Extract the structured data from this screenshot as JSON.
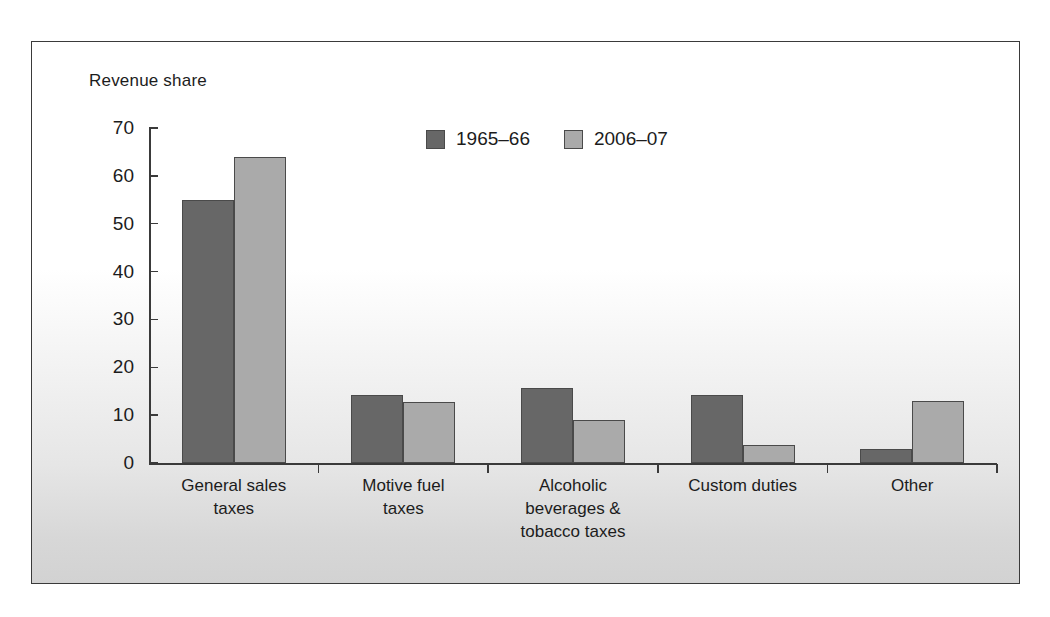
{
  "chart_data": {
    "type": "bar",
    "title": "",
    "subtitle": "",
    "ylabel": "Revenue share",
    "xlabel": "",
    "ylim": [
      0,
      70
    ],
    "yticks": [
      0,
      10,
      20,
      30,
      40,
      50,
      60,
      70
    ],
    "ytick_labels": [
      "0",
      "10",
      "20",
      "30",
      "40",
      "50",
      "60",
      "70"
    ],
    "grid": false,
    "legend_position": "top-center",
    "categories": [
      "General sales\ntaxes",
      "Motive fuel\ntaxes",
      "Alcoholic\nbeverages &\ntobacco taxes",
      "Custom duties",
      "Other"
    ],
    "series": [
      {
        "name": "1965–66",
        "color": "#676767",
        "values": [
          55,
          14.2,
          15.6,
          14.2,
          3
        ]
      },
      {
        "name": "2006–07",
        "color": "#aaaaaa",
        "values": [
          64,
          12.7,
          9,
          3.8,
          13
        ]
      }
    ]
  },
  "legend": {
    "items": [
      {
        "label": "1965–66",
        "color": "#676767"
      },
      {
        "label": "2006–07",
        "color": "#aaaaaa"
      }
    ]
  },
  "colors": {
    "series_1965_66": "#676767",
    "series_2006_07": "#aaaaaa",
    "axis": "#3a3a3a",
    "frame_border": "#3a3a3a",
    "text": "#1c1c1c"
  }
}
